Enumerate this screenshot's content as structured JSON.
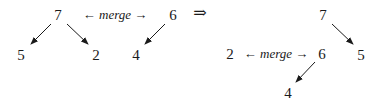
{
  "diagram": {
    "implies_symbol": "⇒",
    "before": {
      "left_tree": {
        "root": "7",
        "children": [
          "5",
          "2"
        ]
      },
      "merge_label": {
        "left_arrow": "←",
        "word": "merge",
        "right_arrow": "→"
      },
      "right_tree": {
        "root": "6",
        "children": [
          "4"
        ]
      }
    },
    "after": {
      "tree": {
        "root": "7",
        "children": [
          "5"
        ]
      },
      "left_node": "2",
      "merge_label": {
        "left_arrow": "←",
        "word": "merge",
        "right_arrow": "→"
      },
      "subtree": {
        "root": "6",
        "children": [
          "4"
        ]
      }
    }
  }
}
